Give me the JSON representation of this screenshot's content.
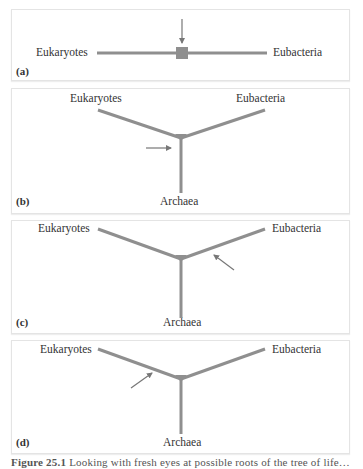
{
  "figure": {
    "colors": {
      "branch": "#8f8f8f",
      "arrow": "#777777",
      "border": "#e4e4e4"
    },
    "panels": [
      {
        "id": "a",
        "label": "(a)",
        "layout": "unrooted-line",
        "taxa": {
          "left": "Eukaryotes",
          "right": "Eubacteria"
        },
        "root_marker": "square",
        "arrow_direction": "down"
      },
      {
        "id": "b",
        "label": "(b)",
        "layout": "y-tree",
        "taxa": {
          "left": "Eukaryotes",
          "right": "Eubacteria",
          "bottom": "Archaea"
        },
        "root_marker": "junction-triangle",
        "arrow_direction": "right",
        "arrow_target": "Archaea branch"
      },
      {
        "id": "c",
        "label": "(c)",
        "layout": "y-tree",
        "taxa": {
          "left": "Eukaryotes",
          "right": "Eubacteria",
          "bottom": "Archaea"
        },
        "root_marker": "junction-triangle",
        "arrow_direction": "up-left",
        "arrow_target": "Eubacteria branch"
      },
      {
        "id": "d",
        "label": "(d)",
        "layout": "y-tree",
        "taxa": {
          "left": "Eukaryotes",
          "right": "Eubacteria",
          "bottom": "Archaea"
        },
        "root_marker": "junction-triangle",
        "arrow_direction": "up-right",
        "arrow_target": "Eukaryotes branch"
      }
    ],
    "caption": {
      "number": "Figure 25.1",
      "text": "Looking with fresh eyes at possible roots of the tree of life…"
    }
  }
}
